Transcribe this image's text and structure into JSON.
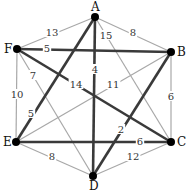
{
  "graph": {
    "nodes": [
      {
        "id": "A",
        "label": "A",
        "x": 95,
        "y": 17,
        "lx": 91,
        "ly": 11
      },
      {
        "id": "B",
        "label": "B",
        "x": 171,
        "y": 52,
        "lx": 177,
        "ly": 56
      },
      {
        "id": "C",
        "label": "C",
        "x": 171,
        "y": 142,
        "lx": 177,
        "ly": 146
      },
      {
        "id": "D",
        "label": "D",
        "x": 93,
        "y": 176,
        "lx": 89,
        "ly": 190
      },
      {
        "id": "E",
        "label": "E",
        "x": 16,
        "y": 142,
        "lx": 3,
        "ly": 146
      },
      {
        "id": "F",
        "label": "F",
        "x": 17,
        "y": 49,
        "lx": 4,
        "ly": 53
      }
    ],
    "edges": [
      {
        "from": "A",
        "to": "F",
        "weight": "13",
        "style": "thin",
        "lx": 52,
        "ly": 34
      },
      {
        "from": "A",
        "to": "B",
        "weight": "8",
        "style": "thin",
        "lx": 133,
        "ly": 34
      },
      {
        "from": "A",
        "to": "D",
        "weight": "4",
        "style": "thick",
        "lx": 95,
        "ly": 71
      },
      {
        "from": "A",
        "to": "E",
        "weight": "5",
        "style": "thick",
        "lx": 31,
        "ly": 115
      },
      {
        "from": "A",
        "to": "C",
        "weight": "15",
        "style": "thin",
        "lx": 106,
        "ly": 37
      },
      {
        "from": "F",
        "to": "B",
        "weight": "5",
        "style": "thick",
        "lx": 47,
        "ly": 50
      },
      {
        "from": "F",
        "to": "C",
        "weight": "14",
        "style": "thick",
        "lx": 76,
        "ly": 86
      },
      {
        "from": "F",
        "to": "D",
        "weight": "7",
        "style": "thin",
        "lx": 33,
        "ly": 77
      },
      {
        "from": "F",
        "to": "E",
        "weight": "10",
        "style": "thin",
        "lx": 17,
        "ly": 96
      },
      {
        "from": "B",
        "to": "E",
        "weight": "11",
        "style": "thin",
        "lx": 113,
        "ly": 86
      },
      {
        "from": "B",
        "to": "D",
        "weight": "2",
        "style": "thick",
        "lx": 121,
        "ly": 131
      },
      {
        "from": "B",
        "to": "C",
        "weight": "6",
        "style": "thin",
        "lx": 171,
        "ly": 98
      },
      {
        "from": "E",
        "to": "C",
        "weight": "6",
        "style": "thick",
        "lx": 140,
        "ly": 143
      },
      {
        "from": "E",
        "to": "D",
        "weight": "8",
        "style": "thin",
        "lx": 52,
        "ly": 158
      },
      {
        "from": "D",
        "to": "C",
        "weight": "12",
        "style": "thin",
        "lx": 133,
        "ly": 158
      }
    ]
  }
}
